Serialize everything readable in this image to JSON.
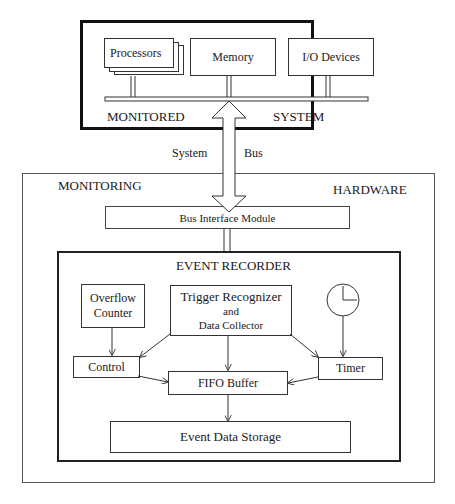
{
  "monitored_system": {
    "title_left": "MONITORED",
    "title_right": "SYSTEM",
    "components": [
      {
        "label": "Processors"
      },
      {
        "label": "Memory"
      },
      {
        "label": "I/O Devices"
      }
    ]
  },
  "system_bus": {
    "label_left": "System",
    "label_right": "Bus"
  },
  "monitoring_hardware": {
    "title_left": "MONITORING",
    "title_right": "HARDWARE",
    "bus_interface": "Bus Interface Module",
    "event_recorder": {
      "title": "EVENT RECORDER",
      "overflow_counter_line1": "Overflow",
      "overflow_counter_line2": "Counter",
      "trigger_line1": "Trigger Recognizer",
      "trigger_line2": "and",
      "trigger_line3": "Data Collector",
      "clock_icon": "clock-icon",
      "control": "Control",
      "fifo": "FIFO Buffer",
      "timer": "Timer",
      "storage": "Event Data Storage"
    }
  }
}
